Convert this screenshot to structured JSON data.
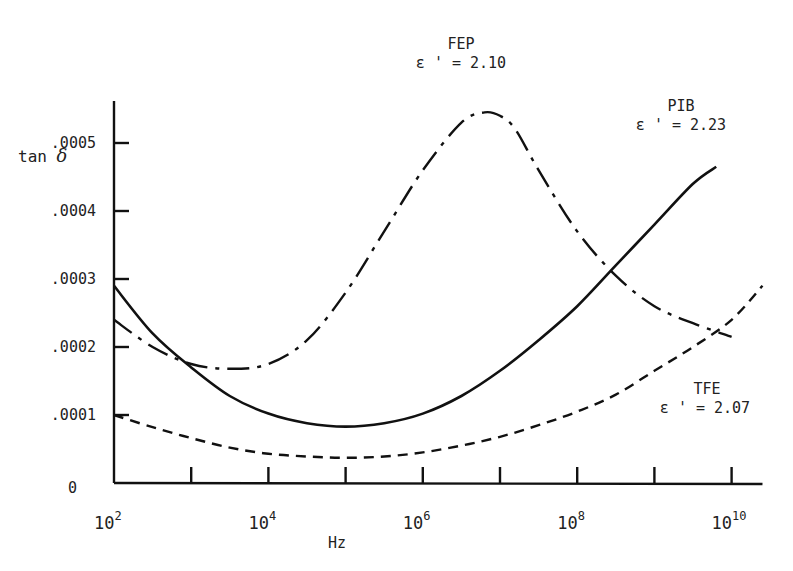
{
  "chart_data": {
    "type": "line",
    "title": "",
    "xlabel": "Hz",
    "ylabel": "tan δ",
    "xscale": "log",
    "xlim_exponent": [
      2,
      10.4
    ],
    "ylim": [
      0,
      0.00055
    ],
    "x_tick_labels": [
      {
        "base": "10",
        "exp": "2",
        "value": 100
      },
      {
        "base": "10",
        "exp": "4",
        "value": 10000
      },
      {
        "base": "10",
        "exp": "6",
        "value": 1000000
      },
      {
        "base": "10",
        "exp": "8",
        "value": 100000000
      },
      {
        "base": "10",
        "exp": "10",
        "value": 10000000000
      }
    ],
    "x_minor_ticks_exponent": [
      3,
      4,
      5,
      6,
      7,
      8,
      9,
      10
    ],
    "y_tick_labels": [
      "0",
      ".0001",
      ".0002",
      ".0003",
      ".0004",
      ".0005"
    ],
    "y_tick_values": [
      0,
      0.0001,
      0.0002,
      0.0003,
      0.0004,
      0.0005
    ],
    "grid": false,
    "legend_position": "inline annotations",
    "series": [
      {
        "name": "FEP",
        "annotation": "ε ' = 2.10",
        "label_line1": "FEP",
        "label_line2": "ε ' = 2.10",
        "style": "dash-dot",
        "log10_x": [
          2.0,
          2.5,
          3.0,
          3.5,
          4.0,
          4.5,
          5.0,
          5.5,
          6.0,
          6.5,
          6.8,
          7.0,
          7.2,
          7.5,
          8.0,
          8.5,
          9.0,
          9.5,
          10.0
        ],
        "y": [
          0.00024,
          0.0002,
          0.000175,
          0.000168,
          0.000175,
          0.00021,
          0.00028,
          0.00037,
          0.00046,
          0.00053,
          0.000545,
          0.00054,
          0.00052,
          0.00046,
          0.00037,
          0.000305,
          0.00026,
          0.000235,
          0.000215
        ]
      },
      {
        "name": "PIB",
        "annotation": "ε ' = 2.23",
        "label_line1": "PIB",
        "label_line2": "ε ' = 2.23",
        "style": "solid",
        "log10_x": [
          2.0,
          2.5,
          3.0,
          3.5,
          4.0,
          4.5,
          5.0,
          5.5,
          6.0,
          6.5,
          7.0,
          7.5,
          8.0,
          8.5,
          9.0,
          9.5,
          9.8
        ],
        "y": [
          0.00029,
          0.00022,
          0.00017,
          0.000128,
          0.000102,
          8.8e-05,
          8.3e-05,
          8.8e-05,
          0.000102,
          0.000128,
          0.000165,
          0.00021,
          0.00026,
          0.00032,
          0.00038,
          0.00044,
          0.000465
        ]
      },
      {
        "name": "TFE",
        "annotation": "ε ' = 2.07",
        "label_line1": "TFE",
        "label_line2": "ε ' = 2.07",
        "style": "dashed",
        "log10_x": [
          2.0,
          2.5,
          3.0,
          3.5,
          4.0,
          4.5,
          5.0,
          5.5,
          6.0,
          6.5,
          7.0,
          7.5,
          8.0,
          8.5,
          9.0,
          9.5,
          10.0,
          10.4
        ],
        "y": [
          0.0001,
          8.2e-05,
          6.6e-05,
          5.2e-05,
          4.3e-05,
          3.9e-05,
          3.7e-05,
          3.9e-05,
          4.5e-05,
          5.5e-05,
          6.8e-05,
          8.5e-05,
          0.000105,
          0.00013,
          0.000165,
          0.0002,
          0.00024,
          0.00029
        ]
      }
    ]
  },
  "labels": {
    "ylabel_text": "tan ",
    "ylabel_symbol": "δ",
    "xlabel": "Hz"
  }
}
